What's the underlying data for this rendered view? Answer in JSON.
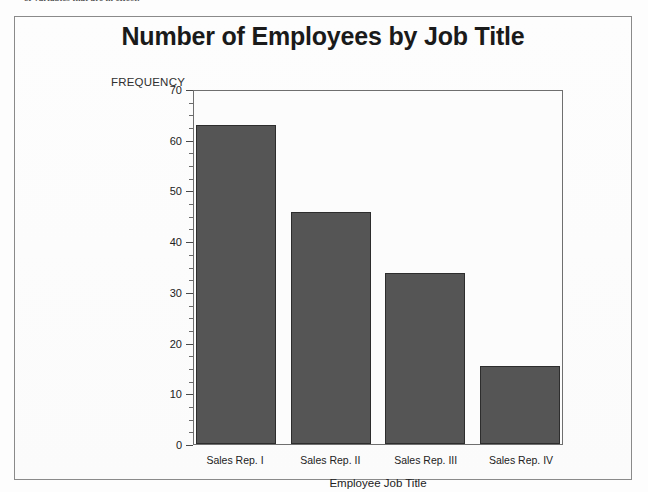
{
  "document": {
    "top_text_fragment": "of variables that are in effect."
  },
  "figure": {
    "title": "Number of Employees by Job Title",
    "y_axis_caption": "FREQUENCY",
    "x_axis_title": "Employee Job Title"
  },
  "colors": {
    "bar_fill": "#555555",
    "bar_border": "#2d2d2d",
    "frame_border": "#8a8a8a",
    "plot_border": "#6f6f6f",
    "title_text": "#1a1a1a",
    "axis_text": "#222222",
    "background": "#fdfdfd"
  },
  "chart_data": {
    "type": "bar",
    "title": "Number of Employees by Job Title",
    "xlabel": "Employee Job Title",
    "ylabel": "FREQUENCY",
    "categories": [
      "Sales Rep. I",
      "Sales Rep. II",
      "Sales Rep. III",
      "Sales Rep. IV"
    ],
    "values": [
      63,
      45.7,
      33.7,
      15.4
    ],
    "ylim": [
      0,
      70
    ],
    "y_ticks": [
      0,
      10,
      20,
      30,
      40,
      50,
      60,
      70
    ],
    "y_tick_labels": [
      "0",
      "10",
      "20",
      "30",
      "40",
      "50",
      "60",
      "70"
    ],
    "y_minor_tick_step": 2.5,
    "grid": false,
    "legend": null,
    "orientation": "vertical"
  }
}
